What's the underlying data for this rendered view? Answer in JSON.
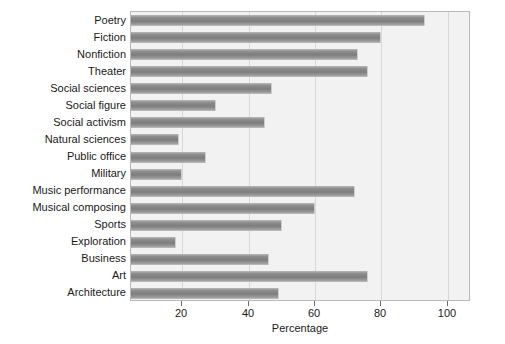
{
  "chart_data": {
    "type": "bar",
    "orientation": "horizontal",
    "title": "",
    "xlabel": "Percentage",
    "ylabel": "",
    "xlim": [
      4.5,
      107
    ],
    "xticks": [
      20,
      40,
      60,
      80,
      100
    ],
    "xtick_labels": [
      "20",
      "40",
      "60",
      "80",
      "100"
    ],
    "grid": true,
    "grid_axis": "x",
    "legend": false,
    "categories": [
      "Poetry",
      "Fiction",
      "Nonfiction",
      "Theater",
      "Social sciences",
      "Social figure",
      "Social activism",
      "Natural sciences",
      "Public office",
      "Military",
      "Music performance",
      "Musical composing",
      "Sports",
      "Exploration",
      "Business",
      "Art",
      "Architecture"
    ],
    "values": [
      93,
      80,
      73,
      76,
      47,
      30,
      45,
      19,
      27,
      20,
      72,
      60,
      50,
      18,
      46,
      76,
      49
    ],
    "bar_color": "#8e8e8e",
    "plot_background": "#f2f2f2",
    "grid_color": "#d8d8d8",
    "frame_color": "#b9b9b9"
  }
}
